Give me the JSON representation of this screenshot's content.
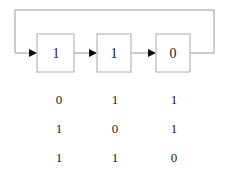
{
  "diagram": {
    "type": "circular shift register",
    "registers": [
      {
        "label": "1"
      },
      {
        "label": "1"
      },
      {
        "label": "0"
      }
    ],
    "feedback": "output of last register loops back to input of first register",
    "colors": {
      "line": "#999999",
      "box": "#aaaaaa",
      "arrow": "#111111",
      "text": "#222222"
    }
  },
  "states_table": {
    "rows": [
      [
        "0",
        "1",
        "1"
      ],
      [
        "1",
        "0",
        "1"
      ],
      [
        "1",
        "1",
        "0"
      ]
    ]
  }
}
